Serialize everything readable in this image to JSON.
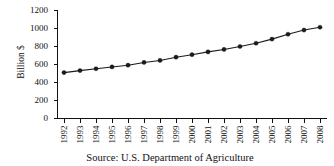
{
  "chart_data": {
    "type": "line",
    "title": "",
    "subtitle": "",
    "xlabel": "",
    "ylabel": "Billion $",
    "caption": "Source: U.S. Department of Agriculture",
    "grid": false,
    "legend": false,
    "legend_position": "none",
    "marker": "filled-circle",
    "line_color": "#1a1a1a",
    "marker_color": "#1a1a1a",
    "background_color": "#ffffff",
    "xlim": [
      1992,
      2008
    ],
    "ylim": [
      0,
      1200
    ],
    "ytick_step": 200,
    "categories": [
      "1992",
      "1993",
      "1994",
      "1995",
      "1996",
      "1997",
      "1998",
      "1999",
      "2000",
      "2001",
      "2002",
      "2003",
      "2004",
      "2005",
      "2006",
      "2007",
      "2008"
    ],
    "ytick_labels": [
      "0",
      "200",
      "400",
      "600",
      "800",
      "1000",
      "1200"
    ],
    "ytick_values": [
      0,
      200,
      400,
      600,
      800,
      1000,
      1200
    ],
    "series": [
      {
        "name": "Food expenditures",
        "values": [
          510,
          532,
          553,
          573,
          592,
          623,
          645,
          681,
          709,
          740,
          767,
          800,
          836,
          882,
          936,
          983,
          1014
        ]
      }
    ]
  },
  "axes": {
    "y_axis_title": "Billion $"
  },
  "figure": {
    "caption": "Source: U.S. Department of Agriculture"
  }
}
